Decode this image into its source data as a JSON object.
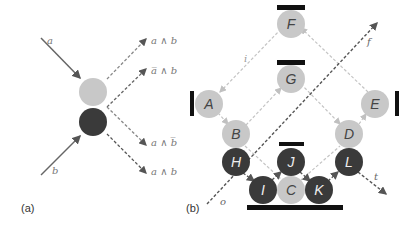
{
  "colors": {
    "light_node": "#c8c8c8",
    "dark_node": "#3a3a3a",
    "light_arrow": "#c4c4c4",
    "dark_arrow": "#555555",
    "bar": "#111111",
    "label": "#666666"
  },
  "panel_a": {
    "label": "(a)",
    "inputs": [
      "a",
      "b"
    ],
    "outputs": [
      "a ∧ b",
      "a̅ ∧ b",
      "a ∧ b̅",
      "a ∧ b"
    ]
  },
  "panel_b": {
    "label": "(b)",
    "light_nodes": [
      "F",
      "G",
      "A",
      "E",
      "B",
      "D",
      "C"
    ],
    "dark_nodes": [
      "H",
      "J",
      "L",
      "I",
      "K"
    ],
    "signals": {
      "input": "o",
      "output_f": "f",
      "output_t": "t",
      "feedback": "i"
    }
  }
}
